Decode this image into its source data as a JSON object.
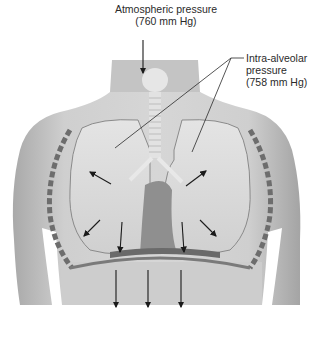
{
  "figure": {
    "panel_label": "(b)",
    "labels": {
      "atmospheric": {
        "line1": "Atmospheric pressure",
        "line2": "(760 mm Hg)"
      },
      "intra_alveolar": {
        "line1": "Intra-alveolar",
        "line2": "pressure",
        "line3": "(758 mm Hg)"
      }
    },
    "arrows": {
      "air_inflow": 1,
      "lung_expansion": 6,
      "diaphragm_descent": 3
    },
    "colors": {
      "skin": "#c9c9c9",
      "skin_shadow": "#9a9a9a",
      "lung": "#dcdcdc",
      "lung_outline": "#8a8a8a",
      "heart": "#8f8f8f",
      "rib_edge": "#6d6d6d",
      "arrow": "#1a1a1a",
      "text": "#2a2a2a"
    }
  }
}
